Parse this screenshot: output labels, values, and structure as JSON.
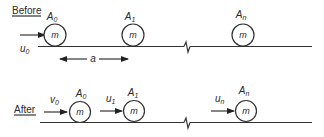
{
  "diagram": {
    "before": {
      "heading": "Before",
      "incoming_velocity": {
        "symbol": "u",
        "subscript": "0"
      },
      "spacing_label": "a",
      "balls": [
        {
          "name": "A",
          "subscript": "0",
          "mass": "m"
        },
        {
          "name": "A",
          "subscript": "1",
          "mass": "m"
        },
        {
          "name": "A",
          "subscript": "n",
          "mass": "m"
        }
      ]
    },
    "after": {
      "heading": "After",
      "balls": [
        {
          "name": "A",
          "subscript": "0",
          "mass": "m",
          "velocity": {
            "symbol": "v",
            "subscript": "0"
          }
        },
        {
          "name": "A",
          "subscript": "1",
          "mass": "m",
          "velocity": {
            "symbol": "u",
            "subscript": "1"
          }
        },
        {
          "name": "A",
          "subscript": "n",
          "mass": "m",
          "velocity": {
            "symbol": "u",
            "subscript": "n"
          }
        }
      ]
    }
  }
}
